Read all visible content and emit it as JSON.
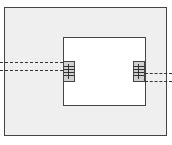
{
  "diagram": {
    "type": "block-with-connectors",
    "outer_frame": {
      "fill": "#efefef",
      "border": "#444444"
    },
    "inner_box": {
      "fill": "#ffffff",
      "border": "#444444"
    },
    "connectors": [
      {
        "side": "left",
        "icon": "connector-icon"
      },
      {
        "side": "right",
        "icon": "connector-icon"
      }
    ],
    "lines": [
      {
        "side": "left",
        "style": "dashed",
        "count": 2
      },
      {
        "side": "right",
        "style": "dashed",
        "count": 2
      }
    ]
  }
}
